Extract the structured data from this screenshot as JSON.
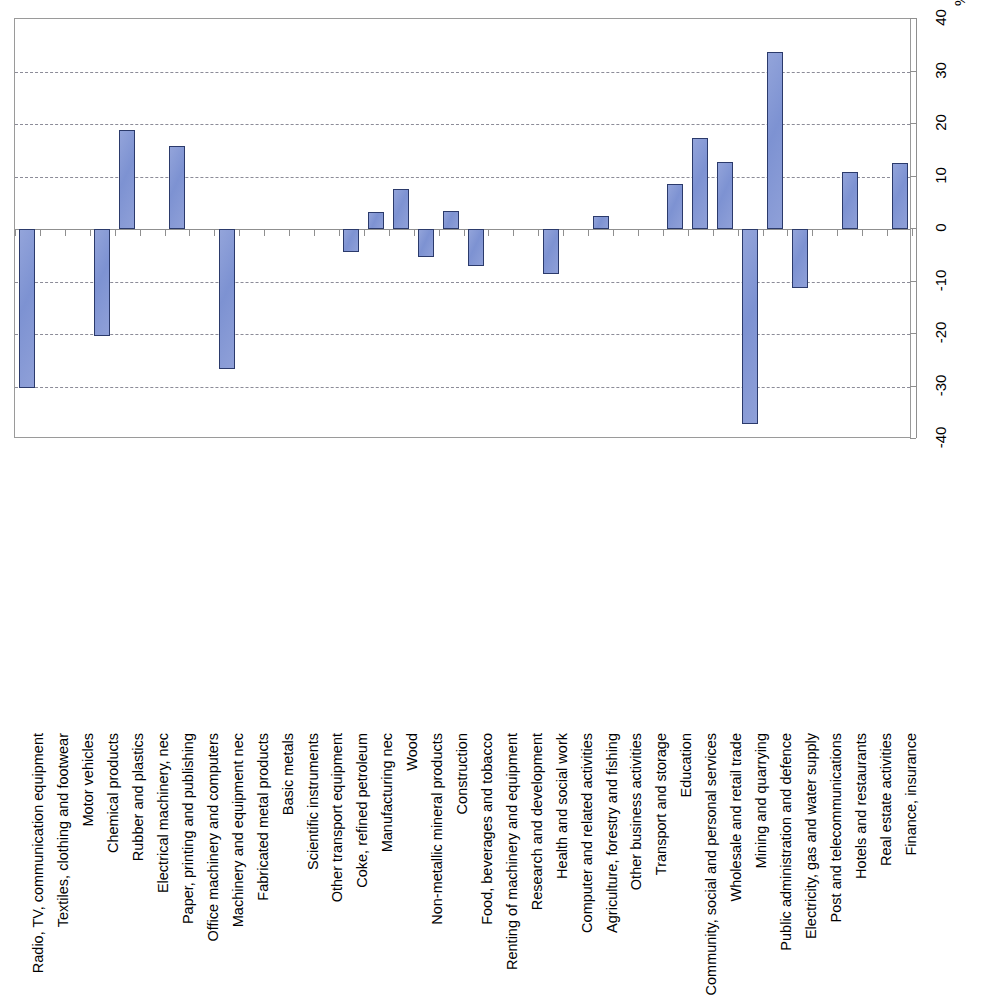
{
  "chart_data": {
    "type": "bar",
    "title": "",
    "subtitle": "",
    "xlabel": "",
    "ylabel": "",
    "unit_label": "%",
    "ylim": [
      -40,
      40
    ],
    "ytick_labels": [
      "40",
      "30",
      "20",
      "10",
      "0",
      "-10",
      "-20",
      "-30",
      "-40"
    ],
    "ytick_values": [
      40,
      30,
      20,
      10,
      0,
      -10,
      -20,
      -30,
      -40
    ],
    "gridlines": [
      30,
      20,
      10,
      -10,
      -20,
      -30
    ],
    "grid": true,
    "legend": null,
    "orientation": "vertical-bars-rotated-labels",
    "series_color": "#8094d4",
    "series_border_color": "#2b3a6b",
    "categories": [
      "Radio, TV, communication equipment",
      "Textiles, clothing and footwear",
      "Motor vehicles",
      "Chemical products",
      "Rubber and plastics",
      "Electrical machinery, nec",
      "Paper, printing and publishing",
      "Office machinery and computers",
      "Machinery and equipment nec",
      "Fabricated metal products",
      "Basic metals",
      "Scientific instruments",
      "Other transport equipment",
      "Coke, refined petroleum",
      "Manufacturing nec",
      "Wood",
      "Non-metallic mineral products",
      "Construction",
      "Food, beverages and tobacco",
      "Renting of machinery and equipment",
      "Research and development",
      "Health and social work",
      "Computer and related activities",
      "Agriculture, forestry and fishing",
      "Other business activities",
      "Transport and storage",
      "Education",
      "Community, social and personal services",
      "Wholesale and retail trade",
      "Mining and quarrying",
      "Public administration and defence",
      "Electricity, gas and water supply",
      "Post and telecommunications",
      "Hotels and restaurants",
      "Real estate activities",
      "Finance, insurance"
    ],
    "values": [
      -30.2,
      null,
      null,
      -20.3,
      18.8,
      null,
      15.8,
      null,
      -26.6,
      null,
      null,
      null,
      null,
      -4.3,
      3.3,
      7.7,
      -5.4,
      3.5,
      -7.0,
      null,
      null,
      -8.5,
      null,
      2.5,
      null,
      null,
      8.5,
      17.4,
      12.8,
      -37.1,
      33.7,
      -11.2,
      null,
      10.8,
      null,
      12.5
    ]
  }
}
